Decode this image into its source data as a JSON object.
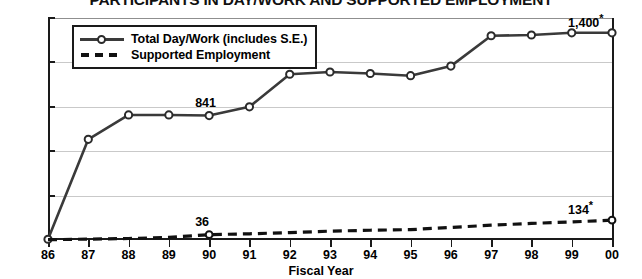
{
  "chart_data": {
    "type": "line",
    "title": "PARTICIPANTS IN DAY/WORK AND SUPPORTED EMPLOYMENT",
    "xlabel": "Fiscal Year",
    "ylabel": "",
    "categories": [
      "86",
      "87",
      "88",
      "89",
      "90",
      "91",
      "92",
      "93",
      "94",
      "95",
      "96",
      "97",
      "98",
      "99",
      "00"
    ],
    "ylim": [
      0,
      1500
    ],
    "yticks": [
      0,
      300,
      600,
      900,
      1200,
      1500
    ],
    "ytick_labels": [
      "0",
      "300",
      "600",
      "900",
      "1,200",
      "1,500"
    ],
    "grid": true,
    "legend_position": "top-left",
    "series": [
      {
        "name": "Total Day/Work (includes S.E.)",
        "style": "solid-with-circle-markers",
        "color": "#3a3a3a",
        "values": [
          5,
          680,
          845,
          845,
          841,
          900,
          1120,
          1135,
          1125,
          1110,
          1175,
          1380,
          1385,
          1400,
          1400
        ]
      },
      {
        "name": "Supported Employment",
        "style": "dashed",
        "color": "#111111",
        "values": [
          2,
          6,
          10,
          18,
          36,
          42,
          50,
          60,
          66,
          70,
          85,
          100,
          112,
          122,
          134
        ]
      }
    ],
    "annotations": [
      {
        "text": "841",
        "series": "Total Day/Work (includes S.E.)",
        "category": "90",
        "value": 841,
        "star": false
      },
      {
        "text": "1,400",
        "series": "Total Day/Work (includes S.E.)",
        "category": "00",
        "value": 1400,
        "star": true
      },
      {
        "text": "36",
        "series": "Supported Employment",
        "category": "90",
        "value": 36,
        "star": false
      },
      {
        "text": "134",
        "series": "Supported Employment",
        "category": "00",
        "value": 134,
        "star": true
      }
    ]
  },
  "legend": {
    "items": [
      {
        "label": "Total Day/Work (includes S.E.)"
      },
      {
        "label": "Supported Employment"
      }
    ]
  },
  "axis": {
    "x_title": "Fiscal Year"
  }
}
